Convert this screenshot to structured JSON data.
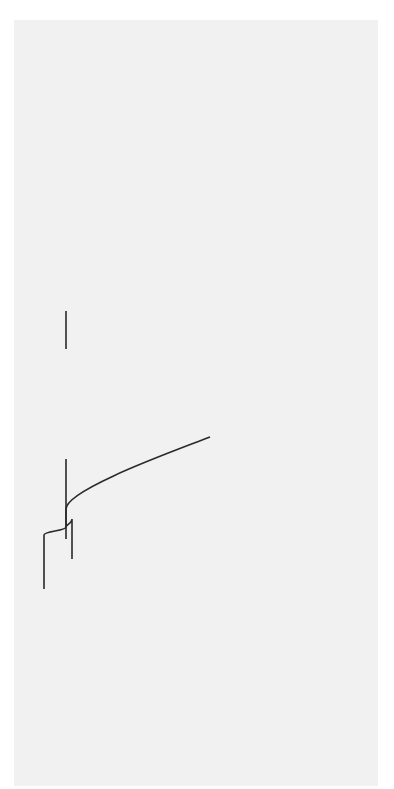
{
  "diagram": {
    "type": "mind-map",
    "orientation": "rotated -90deg",
    "center": "Funktionen der Niere",
    "branches": [
      {
        "label": "Wasserhaushalt",
        "children": [
          {
            "label": "Ödeme",
            "arrow": "up"
          },
          {
            "label": "Volumenmangel",
            "arrow": "up"
          }
        ]
      },
      {
        "label": "Säure-Basen-Haushalt",
        "children": [
          {
            "label": "metabolische Azidose",
            "arrow": "up"
          }
        ]
      },
      {
        "label": "Knochenstoffwechsel",
        "children": [
          {
            "label": "Vitamin-D-Mangel",
            "children": [
              {
                "label": "Kalziummangel",
                "arrow": "up"
              },
              {
                "label": "Hyperparathyreoidismus",
                "arrow": "up"
              }
            ]
          },
          {
            "label": "verminderte Phosphatausscheidung",
            "children": [
              {
                "label": "Hyperphosphatämie",
                "arrow": "up"
              }
            ]
          }
        ]
      },
      {
        "label": "Blutdruckregulation",
        "children": [
          {
            "label": "renale Hypertonie",
            "arrow": "up"
          }
        ]
      },
      {
        "label": "Elektrolythaushalt",
        "children": [
          {
            "label": "Hyperkaliämie",
            "arrow": "down"
          }
        ]
      },
      {
        "label": "Epobildung",
        "children": [
          {
            "label": "renale Anämie",
            "arrow": "down"
          }
        ]
      },
      {
        "label": "Ausscheidung von Giftstoffen",
        "children": [
          {
            "label": "Urämie",
            "arrow": "down"
          }
        ]
      },
      {
        "label": "Ausscheidung von Medikamenten",
        "children": [
          {
            "label": "Medikamentenüberdosierungen",
            "arrow": "down"
          }
        ]
      }
    ]
  },
  "labels": {
    "center": "Funktionen der Niere",
    "wasserhaushalt": "Wasserhaushalt",
    "oedeme": "Ödeme",
    "volumenmangel": "Volumenmangel",
    "saeure_basen": "Säure-Basen-Haushalt",
    "azidose": "metabolische Azidose",
    "knochen": "Knochenstoffwechsel",
    "vitamin_d": "Vitamin-D-Mangel",
    "kalzium": "Kalziummangel",
    "hyperpara": "Hyperparathyreoidismus",
    "phosphat_1": "verminderte",
    "phosphat_2": "Phosphatausscheidung",
    "hyperphos": "Hyperphosphatämie",
    "blutdruck": "Blutdruckregulation",
    "hypertonie": "renale Hypertonie",
    "elektrolyt": "Elektrolythaushalt",
    "hyperkali": "Hyperkaliämie",
    "epo": "Epobildung",
    "anaemie": "renale Anämie",
    "gift": "Ausscheidung von Giftstoffen",
    "uraemie": "Urämie",
    "medik": "Ausscheidung von Medikamenten",
    "ueberdos": "Medikamentenüberdosierungen"
  },
  "colors": {
    "background": "#f1f1f1",
    "line": "#2a2a2a",
    "arrow_fill": "#9a9a9a",
    "arrow_stem": "#555555"
  }
}
